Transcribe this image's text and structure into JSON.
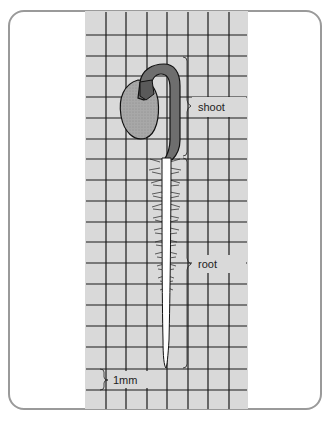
{
  "diagram": {
    "labels": {
      "shoot": "shoot",
      "root": "root",
      "scale": "1mm"
    },
    "colors": {
      "grid_background": "#d9d9d9",
      "grid_line": "#1a1a1a",
      "shoot": "#6e6e6e",
      "seed": "#a9a9a9",
      "root": "#ffffff",
      "card_border": "#9a9a9a"
    }
  }
}
